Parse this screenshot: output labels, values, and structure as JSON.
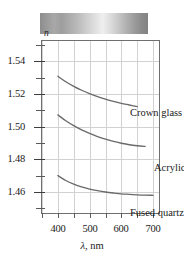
{
  "figure": {
    "spectrum_strip": {
      "name": "visible-spectrum-grayscale-bar",
      "alt": "grayscale spectrum bar"
    },
    "y_axis_title": "n",
    "x_axis_title_symbol": "λ",
    "x_axis_title_unit": ", nm"
  },
  "chart_data": {
    "type": "line",
    "title": "",
    "subtitle": "",
    "xlabel": "λ, nm",
    "ylabel": "n",
    "xlim": [
      350,
      725
    ],
    "ylim": [
      1.446,
      1.552
    ],
    "xticks": [
      400,
      500,
      600,
      700
    ],
    "xtick_labels": [
      "400",
      "500",
      "600",
      "700"
    ],
    "x_minor_ticks": [
      350,
      450,
      550,
      650
    ],
    "yticks": [
      1.54,
      1.52,
      1.5,
      1.48,
      1.46
    ],
    "ytick_labels": [
      "1.54",
      "1.52",
      "1.50",
      "1.48",
      "1.46"
    ],
    "y_minor_ticks": [
      1.55,
      1.53,
      1.51,
      1.49,
      1.47,
      1.45
    ],
    "grid": true,
    "grid_color": "#d2d2d2",
    "axis_color": "#6f6f6f",
    "curve_color": "#6a6a6a",
    "legend_position": "inline-annotations",
    "series": [
      {
        "name": "Crown glass",
        "x": [
          400,
          425,
          450,
          475,
          500,
          525,
          550,
          575,
          600,
          625,
          650
        ],
        "y": [
          1.5305,
          1.5272,
          1.5244,
          1.522,
          1.5199,
          1.5181,
          1.5166,
          1.5152,
          1.514,
          1.513,
          1.512
        ]
      },
      {
        "name": "Acrylic",
        "x": [
          400,
          425,
          450,
          475,
          500,
          525,
          550,
          575,
          600,
          625,
          650,
          675
        ],
        "y": [
          1.507,
          1.5034,
          1.5004,
          1.4978,
          1.4957,
          1.4938,
          1.4922,
          1.4908,
          1.4897,
          1.4888,
          1.4882,
          1.4878
        ]
      },
      {
        "name": "Fused quartz",
        "x": [
          400,
          425,
          450,
          475,
          500,
          525,
          550,
          575,
          600,
          625,
          650,
          675,
          700
        ],
        "y": [
          1.47,
          1.467,
          1.4648,
          1.4631,
          1.4618,
          1.4608,
          1.46,
          1.4594,
          1.4589,
          1.4586,
          1.4583,
          1.4581,
          1.458
        ]
      }
    ],
    "annotations": [
      {
        "text": "Crown glass",
        "series": "Crown glass"
      },
      {
        "text": "Acrylic",
        "series": "Acrylic"
      },
      {
        "text": "Fused quartz",
        "series": "Fused quartz"
      }
    ]
  }
}
